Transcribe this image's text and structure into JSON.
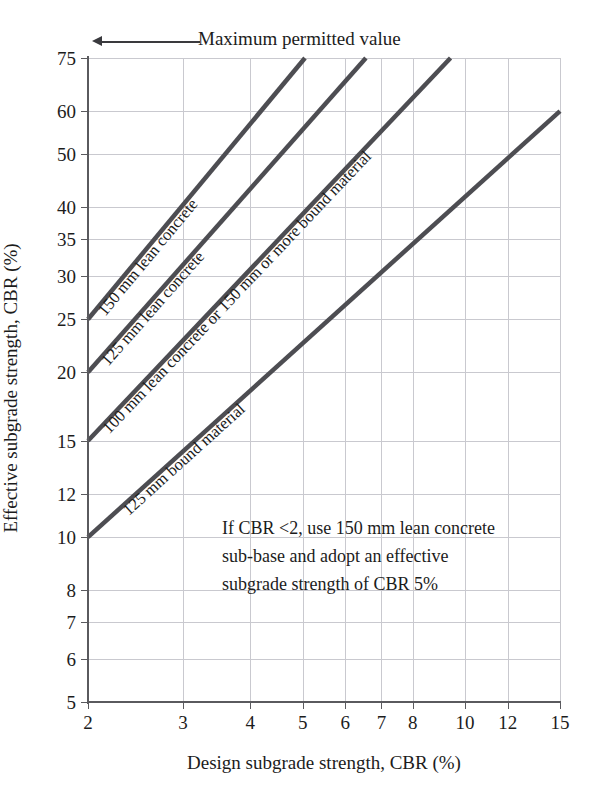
{
  "chart_data": {
    "type": "line",
    "title": "",
    "xlabel": "Design subgrade strength, CBR (%)",
    "ylabel": "Effective subgrade strength, CBR (%)",
    "xscale": "log",
    "yscale": "log",
    "xlim": [
      2,
      15
    ],
    "ylim": [
      5,
      75
    ],
    "grid": true,
    "legend_position": "inline-on-curve",
    "xticks": [
      2,
      3,
      4,
      5,
      6,
      7,
      8,
      10,
      12,
      15
    ],
    "xticklabels": [
      "2",
      "3",
      "4",
      "5",
      "6",
      "7",
      "8",
      "10",
      "12",
      "15"
    ],
    "yticks": [
      5,
      6,
      7,
      8,
      10,
      12,
      15,
      20,
      25,
      30,
      35,
      40,
      50,
      60,
      75
    ],
    "yticklabels": [
      "5",
      "6",
      "7",
      "8",
      "10",
      "12",
      "15",
      "20",
      "25",
      "30",
      "35",
      "40",
      "50",
      "60",
      "75"
    ],
    "series": [
      {
        "name": "150 mm lean concrete",
        "label": "150 mm lean concrete",
        "color": "#4d4d52",
        "points": [
          [
            2,
            25
          ],
          [
            5.05,
            75
          ]
        ]
      },
      {
        "name": "125 mm lean concrete",
        "label": "125 mm lean concrete",
        "color": "#4d4d52",
        "points": [
          [
            2,
            20
          ],
          [
            6.55,
            75
          ]
        ]
      },
      {
        "name": "100 mm lean concrete or 150 mm or more bound material",
        "label": "100 mm lean concrete or 150 mm or more bound material",
        "color": "#4d4d52",
        "points": [
          [
            2,
            15
          ],
          [
            9.4,
            75
          ]
        ]
      },
      {
        "name": "125 mm bound material",
        "label": "125 mm bound material",
        "color": "#4d4d52",
        "points": [
          [
            2,
            10
          ],
          [
            15,
            60
          ]
        ]
      }
    ],
    "annotations": [
      {
        "name": "maximum-permitted-value",
        "text": "Maximum permitted value",
        "arrow": "left"
      },
      {
        "name": "cbr-note",
        "lines": [
          "If CBR <2, use 150 mm lean concrete",
          "sub-base and adopt an effective",
          "subgrade strength of CBR 5%"
        ]
      }
    ]
  },
  "colors": {
    "line": "#4d4d52",
    "grid": "#c9c9cf",
    "axis": "#5a5a5e",
    "text": "#1c1c1c",
    "background": "#ffffff"
  }
}
